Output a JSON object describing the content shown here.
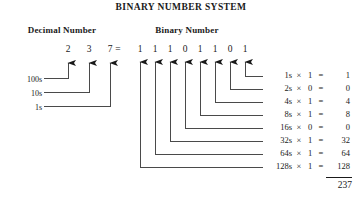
{
  "title": "BINARY NUMBER SYSTEM",
  "headings": {
    "decimal": "Decimal Number",
    "binary": "Binary Number"
  },
  "equals_sign": "=",
  "decimal": {
    "digits": [
      "2",
      "3",
      "7"
    ],
    "place_labels": [
      "100s",
      "10s",
      "1s"
    ]
  },
  "binary": {
    "digits": [
      "1",
      "1",
      "1",
      "0",
      "1",
      "1",
      "0",
      "1"
    ]
  },
  "calculations": [
    {
      "place": "1s",
      "times": "×",
      "bit": "1",
      "eq": "=",
      "value": "1"
    },
    {
      "place": "2s",
      "times": "×",
      "bit": "0",
      "eq": "=",
      "value": "0"
    },
    {
      "place": "4s",
      "times": "×",
      "bit": "1",
      "eq": "=",
      "value": "4"
    },
    {
      "place": "8s",
      "times": "×",
      "bit": "1",
      "eq": "=",
      "value": "8"
    },
    {
      "place": "16s",
      "times": "×",
      "bit": "0",
      "eq": "=",
      "value": "0"
    },
    {
      "place": "32s",
      "times": "×",
      "bit": "1",
      "eq": "=",
      "value": "32"
    },
    {
      "place": "64s",
      "times": "×",
      "bit": "1",
      "eq": "=",
      "value": "64"
    },
    {
      "place": "128s",
      "times": "×",
      "bit": "1",
      "eq": "=",
      "value": "128"
    }
  ],
  "sum": "237",
  "colors": {
    "ink": "#1a1a1a",
    "rule": "#4a4a4a",
    "background": "#ffffff"
  }
}
